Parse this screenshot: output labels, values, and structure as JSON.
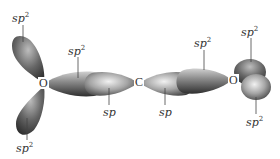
{
  "diagram": {
    "atoms": [
      {
        "symbol": "O",
        "position": "left"
      },
      {
        "symbol": "C",
        "position": "center"
      },
      {
        "symbol": "O",
        "position": "right"
      }
    ],
    "labels": [
      {
        "text": "sp",
        "sup": "2",
        "target": "left O upper lone-pair orbital"
      },
      {
        "text": "sp",
        "sup": "2",
        "target": "left O lower lone-pair orbital"
      },
      {
        "text": "sp",
        "sup": "2",
        "target": "left O bonding orbital"
      },
      {
        "text": "sp",
        "sup": "",
        "target": "C left bonding orbital"
      },
      {
        "text": "sp",
        "sup": "",
        "target": "C right bonding orbital"
      },
      {
        "text": "sp",
        "sup": "2",
        "target": "right O bonding orbital"
      },
      {
        "text": "sp",
        "sup": "2",
        "target": "right O upper lone-pair orbital"
      },
      {
        "text": "sp",
        "sup": "2",
        "target": "right O lower lone-pair orbital"
      }
    ],
    "colors": {
      "lobe_dark": "#3a3a3a",
      "lobe_mid": "#7a7a7a",
      "lobe_light": "#d8d8d8",
      "text": "#333333",
      "background": "#ffffff"
    }
  }
}
